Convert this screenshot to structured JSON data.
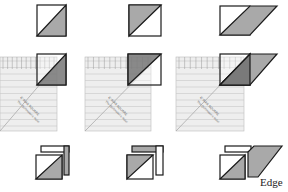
{
  "diagram": {
    "rows": [
      "cut square",
      "ruler placement",
      "resulting pieces"
    ],
    "columns": [
      {
        "name": "light-bottom-right-gray",
        "shape": "square",
        "gray_half": "bottom-right"
      },
      {
        "name": "gray-top-left",
        "shape": "square",
        "gray_half": "top-left"
      },
      {
        "name": "parallelogram",
        "shape": "square-with-parallelogram",
        "gray_half": "bottom-right"
      }
    ],
    "ruler": {
      "label_line1": "6\" BIAS SQUARE",
      "label_line2": "The Quiltmaker's Ruler"
    },
    "edge_label": "Edge"
  },
  "colors": {
    "gray_fill": "#a9a9a9",
    "dark_gray_fill": "#6e6e6e",
    "stroke": "#1a1a1a",
    "ruler_fill": "#eeeeee",
    "ruler_line": "#c8c8c8"
  }
}
